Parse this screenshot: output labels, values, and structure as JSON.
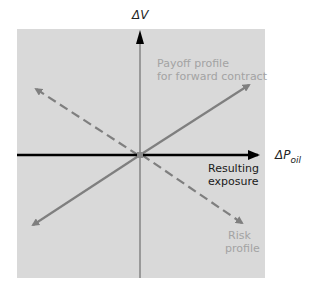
{
  "diagram": {
    "y_axis_label": "ΔV",
    "x_axis_label_main": "ΔP",
    "x_axis_label_sub": "oil",
    "payoff_label_line1": "Payoff profile",
    "payoff_label_line2": "for forward contract",
    "resulting_label_line1": "Resulting",
    "resulting_label_line2": "exposure",
    "risk_label_line1": "Risk",
    "risk_label_line2": "profile",
    "colors": {
      "panel_bg": "#d9d9d9",
      "profile_line": "#7f7f7f",
      "axis": "#000000",
      "gray_text": "#a3a3a3"
    }
  }
}
